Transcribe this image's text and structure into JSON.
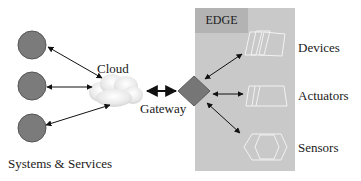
{
  "diagram": {
    "edge_label": "EDGE",
    "cloud_label": "Cloud",
    "gateway_label": "Gateway",
    "systems_label": "Systems & Services",
    "edge_items": [
      {
        "label": "Devices",
        "icon": "device-stack-icon"
      },
      {
        "label": "Actuators",
        "icon": "actuator-icon"
      },
      {
        "label": "Sensors",
        "icon": "sensor-hexagon-icon"
      }
    ],
    "system_nodes": 3,
    "colors": {
      "node_fill": "#7b7b7b",
      "gateway_fill": "#767676",
      "edge_region": "#c9c9c9",
      "edge_title_bg": "#b3b3b3",
      "icon_outline": "#f2f2f2",
      "arrow": "#111111"
    }
  }
}
